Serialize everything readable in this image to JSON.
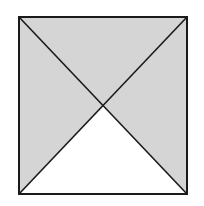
{
  "diagram": {
    "shape": "square-with-diagonals",
    "square": {
      "x1": 19,
      "y1": 17,
      "x2": 187,
      "y2": 194
    },
    "center": {
      "x": 104,
      "y": 106
    },
    "regions": [
      {
        "name": "top-triangle",
        "shaded": true
      },
      {
        "name": "left-triangle",
        "shaded": true
      },
      {
        "name": "right-triangle",
        "shaded": true
      },
      {
        "name": "bottom-triangle",
        "shaded": false
      }
    ],
    "colors": {
      "shade": "#d5d5d5",
      "unshaded": "#ffffff",
      "stroke": "#1a1a1a",
      "background": "#ffffff"
    }
  }
}
